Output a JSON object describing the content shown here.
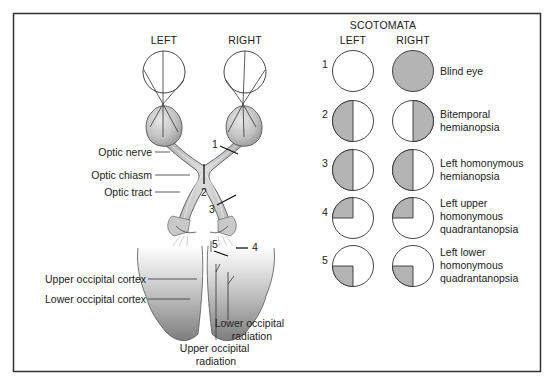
{
  "anatomy": {
    "headers": {
      "left": "LEFT",
      "right": "RIGHT"
    },
    "labels": {
      "optic_nerve": "Optic nerve",
      "optic_chiasm": "Optic chiasm",
      "optic_tract": "Optic tract",
      "upper_occipital_cortex": "Upper occipital cortex",
      "lower_occipital_cortex": "Lower occipital cortex",
      "lower_occipital_radiation_1": "Lower occipital",
      "lower_occipital_radiation_2": "radiation",
      "upper_occipital_radiation_1": "Upper occipital",
      "upper_occipital_radiation_2": "radiation"
    },
    "lesion_markers": [
      "1",
      "2",
      "3",
      "4",
      "5"
    ]
  },
  "scotomata": {
    "title": "SCOTOMATA",
    "col_left": "LEFT",
    "col_right": "RIGHT",
    "fill_color": "#b4b4b4",
    "rows": [
      {
        "num": "1",
        "left": "none",
        "right": "full",
        "label_1": "Blind eye",
        "label_2": "",
        "label_3": ""
      },
      {
        "num": "2",
        "left": "left-half",
        "right": "right-half",
        "label_1": "Bitemporal",
        "label_2": "hemianopsia",
        "label_3": ""
      },
      {
        "num": "3",
        "left": "left-half",
        "right": "left-half",
        "label_1": "Left homonymous",
        "label_2": "hemianopsia",
        "label_3": ""
      },
      {
        "num": "4",
        "left": "upper-left-quadrant",
        "right": "upper-left-quadrant",
        "label_1": "Left upper",
        "label_2": "homonymous",
        "label_3": "quadrantanopsia"
      },
      {
        "num": "5",
        "left": "lower-left-quadrant",
        "right": "lower-left-quadrant",
        "label_1": "Left lower",
        "label_2": "homonymous",
        "label_3": "quadrantanopsia"
      }
    ]
  }
}
